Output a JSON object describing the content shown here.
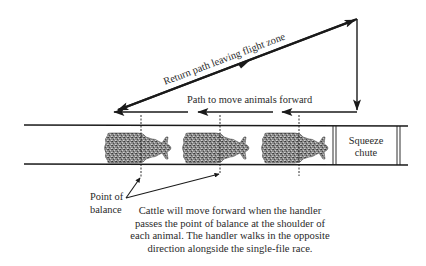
{
  "diagram": {
    "return_path_label": "Return path leaving flight zone",
    "forward_path_label": "Path to move animals forward",
    "squeeze_chute": {
      "line1": "Squeeze",
      "line2": "chute"
    },
    "point_of_balance": {
      "line1": "Point of",
      "line2": "balance"
    },
    "caption": {
      "line1": "Cattle will move forward when the handler",
      "line2": "passes the point of balance at the shoulder of",
      "line3": "each animal. The handler walks in the opposite",
      "line4": "direction alongside the single-file race."
    },
    "animals": [
      {
        "name": "animal-1",
        "balance_line_x": 141
      },
      {
        "name": "animal-2",
        "balance_line_x": 220
      },
      {
        "name": "animal-3",
        "balance_line_x": 299
      }
    ],
    "colors": {
      "line": "#1a1a1a",
      "animal_fill": "#7a7a7a",
      "text": "#2a2a2a"
    }
  }
}
